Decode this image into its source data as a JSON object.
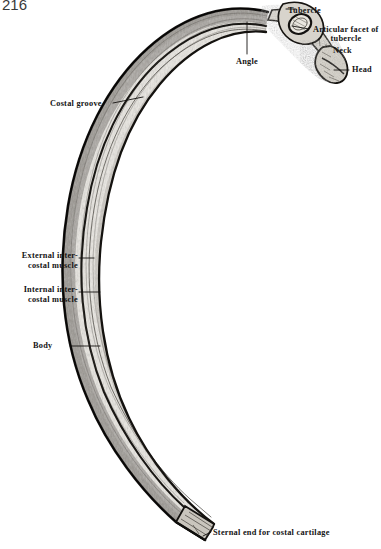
{
  "plate": {
    "page_number": "216",
    "subject": "rib",
    "background_color": "#ffffff",
    "ink_color": "#141414"
  },
  "labels": {
    "tubercle": "Tubercle",
    "articular_facet": "Articular facet of tubercle",
    "neck": "Neck",
    "head": "Head",
    "angle": "Angle",
    "costal_groove": "Costal groove",
    "external_intercostal": "External inter-costal muscle",
    "internal_intercostal": "Internal inter-costal muscle",
    "body": "Body",
    "sternal_end": "Sternal end for costal cartilage"
  },
  "label_lines": {
    "external_intercostal_line1": "External inter-",
    "external_intercostal_line2": "costal muscle",
    "internal_intercostal_line1": "Internal inter-",
    "internal_intercostal_line2": "costal muscle",
    "articular_facet_line1": "Articular facet of",
    "articular_facet_line2": "tubercle"
  },
  "figure": {
    "type": "anatomical-engraving",
    "orientation": "rib viewed from inner surface, vertebral end upper right, sternal end lower centre",
    "parts": [
      "head",
      "neck",
      "tubercle",
      "articular facet of tubercle",
      "angle",
      "costal groove",
      "body",
      "sternal end for costal cartilage"
    ]
  }
}
